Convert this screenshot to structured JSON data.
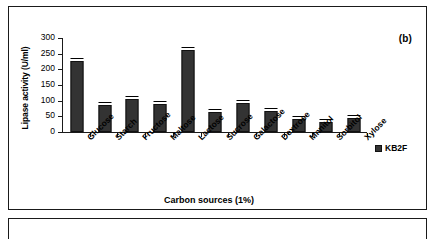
{
  "figure": {
    "panel_label": "(b)"
  },
  "chart_data": {
    "type": "bar",
    "title": "",
    "xlabel": "Carbon sources (1%)",
    "ylabel": "Lipase activity (U/ml)",
    "categories": [
      "Glucose",
      "Starch",
      "Fructose",
      "Maltose",
      "Lactose",
      "Sucrose",
      "Galactose",
      "Dextrose",
      "Mnnitol",
      "Sorbitol",
      "Xylose"
    ],
    "series": [
      {
        "name": "KB2F",
        "values": [
          225,
          85,
          105,
          90,
          260,
          62,
          92,
          65,
          40,
          30,
          45
        ],
        "color": "#333333"
      }
    ],
    "ylim": [
      0,
      300
    ],
    "yticks": [
      0,
      50,
      100,
      150,
      200,
      250,
      300
    ],
    "ytick_labels": [
      "0",
      "50",
      "100",
      "150",
      "200",
      "250",
      "300"
    ],
    "grid": false,
    "legend_position": "right",
    "error_bars": true
  },
  "legend": {
    "entries": [
      {
        "label": "KB2F",
        "swatch_name": "legend-swatch-kb2f"
      }
    ]
  }
}
